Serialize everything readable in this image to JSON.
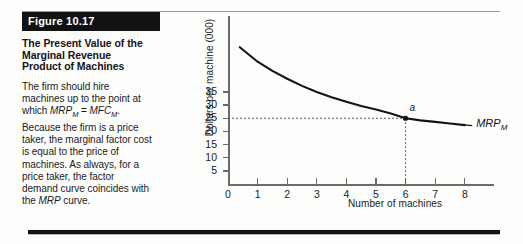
{
  "figure": {
    "number_label": "Figure 10.17",
    "title": "The Present Value of the Marginal Revenue Product of Machines",
    "title_lines": [
      "The Present Value of the",
      "Marginal Revenue",
      "Product of Machines"
    ],
    "body_text": "The firm should hire machines up to the point at which MRPM = MFCM. Because the firm is a price taker, the marginal factor cost is equal to the price of machines. As always, for a price taker, the factor demand curve coincides with the MRP curve.",
    "body_segments": [
      {
        "text": "The firm should hire machines up to the point at which ",
        "style": "normal"
      },
      {
        "text": "MRP",
        "style": "italic"
      },
      {
        "text": "M",
        "style": "sub-italic"
      },
      {
        "text": " = ",
        "style": "normal"
      },
      {
        "text": "MFC",
        "style": "italic"
      },
      {
        "text": "M",
        "style": "sub-italic"
      },
      {
        "text": ". Because the firm is a price taker, the marginal factor cost is equal to the price of machines. As always, for a price taker, the factor demand curve coincides with the ",
        "style": "normal"
      },
      {
        "text": "MRP",
        "style": "italic"
      },
      {
        "text": " curve.",
        "style": "normal"
      }
    ],
    "colors": {
      "title_bar_bg": "#121212",
      "title_bar_fg": "#ffffff",
      "rule": "#6d6d6d",
      "text": "#1b1b1b"
    }
  },
  "chart_data": {
    "type": "line",
    "title": "",
    "xlabel": "Number of machines",
    "ylabel": "Dollars per machine (000)",
    "xlim": [
      0,
      8.8
    ],
    "ylim": [
      0,
      55
    ],
    "xticks": [
      0,
      1,
      2,
      3,
      4,
      5,
      6,
      7,
      8
    ],
    "xtick_labels": [
      "0",
      "1",
      "2",
      "3",
      "4",
      "5",
      "6",
      "7",
      "8"
    ],
    "yticks": [
      5,
      10,
      15,
      20,
      25,
      30,
      35
    ],
    "ytick_labels": [
      "5",
      "10",
      "15",
      "20",
      "25",
      "30",
      "35"
    ],
    "grid": false,
    "legend": "none",
    "series": [
      {
        "name": "MRPM",
        "label": "MRP",
        "label_subscript": "M",
        "color": "#141414",
        "x": [
          0.4,
          1.0,
          1.5,
          2.0,
          2.5,
          3.0,
          3.5,
          4.0,
          4.5,
          5.0,
          5.5,
          6.0,
          6.5,
          7.0,
          7.5,
          8.0
        ],
        "y": [
          52.0,
          46.5,
          43.0,
          40.0,
          37.3,
          35.0,
          33.0,
          31.3,
          29.7,
          28.3,
          26.8,
          25.0,
          24.2,
          23.6,
          23.0,
          22.4
        ]
      }
    ],
    "annotations": [
      {
        "name": "point-a",
        "label": "a",
        "x": 6,
        "y": 25,
        "marker": "dot",
        "guides": [
          "horizontal-dotted-to-y-axis",
          "vertical-dotted-to-x-axis"
        ]
      }
    ]
  }
}
